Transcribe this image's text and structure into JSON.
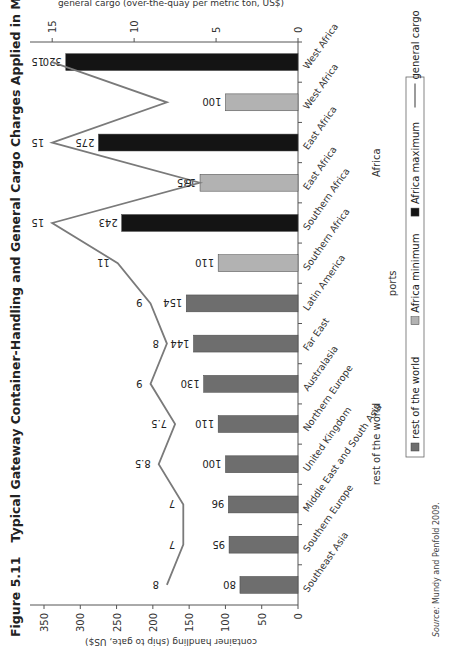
{
  "figure": {
    "number": "Figure 5.11",
    "title": "Typical Gateway Container-Handling and General Cargo Charges Applied in Major African and World Ports"
  },
  "source": {
    "label": "Source:",
    "text": "Mundy and Penfold 2009."
  },
  "colors": {
    "rest_of_world": "#6e6e6e",
    "africa_minimum": "#b2b2b2",
    "africa_maximum": "#141414",
    "general_cargo": "#7a7a7a"
  },
  "chart_data": {
    "type": "bar",
    "title": "Typical Gateway Container-Handling and General Cargo Charges Applied in Major African and World Ports",
    "xlabel": "ports",
    "ylabel": "container handling (ship to gate, US$)",
    "y2label": "general cargo (over-the-quay per metric ton, US$)",
    "ylim": [
      0,
      350
    ],
    "y_ticks": [
      0,
      50,
      100,
      150,
      200,
      250,
      300,
      350
    ],
    "y2lim": [
      0,
      15.5
    ],
    "y2_ticks": [
      0,
      5,
      10,
      15
    ],
    "grid": false,
    "legend_position": "bottom",
    "group_labels": [
      "rest of the world",
      "Africa"
    ],
    "categories": [
      "Southeast Asia",
      "Southern Europe",
      "Middle East and South Asia",
      "United Kingdom",
      "Northern Europe",
      "Australasia",
      "Far East",
      "Latin America",
      "Southern Africa",
      "Southern Africa",
      "East Africa",
      "East Africa",
      "West Africa",
      "West Africa"
    ],
    "bar_series": [
      "rest of the world",
      "rest of the world",
      "rest of the world",
      "rest of the world",
      "rest of the world",
      "rest of the world",
      "rest of the world",
      "rest of the world",
      "Africa minimum",
      "Africa maximum",
      "Africa minimum",
      "Africa maximum",
      "Africa minimum",
      "Africa maximum"
    ],
    "series": [
      {
        "name": "container handling",
        "values": [
          80,
          95,
          96,
          100,
          110,
          130,
          144,
          154,
          110,
          243,
          135,
          275,
          100,
          320
        ]
      },
      {
        "name": "general cargo",
        "values": [
          8,
          7,
          7,
          8.5,
          7.5,
          9,
          8,
          9,
          11,
          15,
          6,
          15,
          8,
          15
        ],
        "value_labels": [
          "8",
          "7",
          "7",
          "8.5",
          "7.5",
          "9",
          "8",
          "9",
          "11",
          "15",
          "6",
          "15",
          "",
          "15"
        ]
      }
    ],
    "legend": [
      "rest of the world",
      "Africa minimum",
      "Africa maximum",
      "general cargo"
    ]
  }
}
